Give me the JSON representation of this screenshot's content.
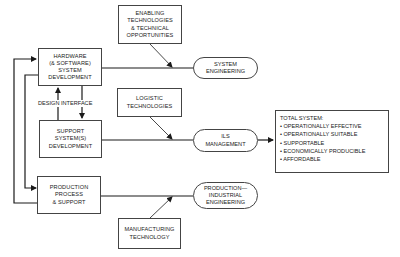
{
  "diagram": {
    "development_boxes": [
      {
        "id": "hardware",
        "lines": [
          "HARDWARE",
          "(& SOFTWARE)",
          "SYSTEM",
          "DEVELOPMENT"
        ]
      },
      {
        "id": "support",
        "lines": [
          "SUPPORT",
          "SYSTEM(S)",
          "DEVELOPMENT"
        ]
      },
      {
        "id": "production",
        "lines": [
          "PRODUCTION",
          "PROCESS",
          "& SUPPORT"
        ]
      }
    ],
    "design_interface_label": "DESIGN INTERFACE",
    "input_boxes": [
      {
        "id": "enabling",
        "lines": [
          "ENABLING",
          "TECHNOLOGIES",
          "& TECHNICAL",
          "OPPORTUNITIES"
        ]
      },
      {
        "id": "logistic",
        "lines": [
          "LOGISTIC",
          "TECHNOLOGIES"
        ]
      },
      {
        "id": "manufacturing",
        "lines": [
          "MANUFACTURING",
          "TECHNOLOGY"
        ]
      }
    ],
    "discipline_ovals": [
      {
        "id": "system-engineering",
        "lines": [
          "SYSTEM",
          "ENGINEERING"
        ]
      },
      {
        "id": "ils-management",
        "lines": [
          "ILS",
          "MANAGEMENT"
        ]
      },
      {
        "id": "production-industrial-engineering",
        "lines": [
          "PRODUCTION—",
          "INDUSTRIAL",
          "ENGINEERING"
        ]
      }
    ],
    "total_system": {
      "title": "TOTAL SYSTEM:",
      "items": [
        "• OPERATIONALLY EFFECTIVE",
        "• OPERATIONALLY SUITABLE",
        "• SUPPORTABLE",
        "• ECONOMICALLY PRODUCIBLE",
        "• AFFORDABLE"
      ]
    },
    "colors": {
      "line": "#1a1a1a",
      "border": "#444444",
      "background": "#ffffff"
    }
  }
}
